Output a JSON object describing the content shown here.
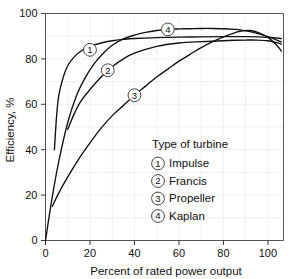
{
  "chart_data": {
    "type": "line",
    "title": "",
    "xlabel": "Percent of rated power output",
    "ylabel": "Efficiency, %",
    "xlim": [
      0,
      107
    ],
    "ylim": [
      0,
      100
    ],
    "xticks": [
      0,
      20,
      40,
      60,
      80,
      100
    ],
    "yticks": [
      0,
      20,
      40,
      60,
      80,
      100
    ],
    "xtick_labels": [
      "0",
      "20",
      "40",
      "60",
      "80",
      "100"
    ],
    "ytick_labels": [
      "0",
      "20",
      "40",
      "60",
      "80",
      "100"
    ],
    "grid": true,
    "grid_step": 10,
    "legend_position": "inside-center-right",
    "legend_title": "Type of turbine",
    "series": [
      {
        "id": 1,
        "name": "Impulse",
        "marker_label": "1",
        "marker_at": {
          "x": 20,
          "y": 84
        },
        "x": [
          4,
          5,
          6,
          8,
          10,
          13,
          16,
          20,
          25,
          30,
          35,
          40,
          50,
          60,
          70,
          80,
          90,
          100,
          106
        ],
        "y": [
          40,
          55,
          64,
          72,
          77,
          81,
          83.5,
          85.5,
          87,
          88,
          88.6,
          89,
          89.4,
          89.6,
          89.7,
          89.8,
          89.8,
          89.5,
          89
        ]
      },
      {
        "id": 2,
        "name": "Francis",
        "marker_label": "2",
        "marker_at": {
          "x": 28,
          "y": 75
        },
        "x": [
          10,
          13,
          16,
          20,
          25,
          30,
          35,
          40,
          50,
          60,
          70,
          80,
          85,
          90,
          95,
          100,
          104,
          106
        ],
        "y": [
          49,
          56,
          61.5,
          66.5,
          72,
          76.5,
          80,
          82.5,
          85.5,
          87,
          87.6,
          88,
          88.2,
          88.3,
          88.3,
          88,
          87.2,
          86.5
        ]
      },
      {
        "id": 3,
        "name": "Propeller",
        "marker_label": "3",
        "marker_at": {
          "x": 40,
          "y": 64
        },
        "x": [
          3,
          6,
          10,
          15,
          20,
          25,
          30,
          35,
          40,
          45,
          50,
          55,
          60,
          65,
          70,
          75,
          80,
          85,
          88,
          92,
          96,
          100,
          104,
          106
        ],
        "y": [
          15,
          21,
          28,
          36,
          43,
          49.5,
          55,
          59.5,
          64,
          68,
          72,
          75.5,
          79,
          82,
          85,
          87.5,
          89.7,
          91.5,
          92.3,
          92.5,
          91.5,
          89.5,
          86,
          83.5
        ]
      },
      {
        "id": 4,
        "name": "Kaplan",
        "marker_label": "4",
        "marker_at": {
          "x": 55,
          "y": 93
        },
        "x": [
          0,
          3,
          6,
          10,
          14,
          18,
          22,
          26,
          30,
          35,
          40,
          45,
          50,
          55,
          60,
          65,
          70,
          75,
          80,
          85,
          88,
          92,
          96,
          100,
          104,
          106
        ],
        "y": [
          0,
          19,
          35,
          52,
          64,
          72,
          78,
          82.5,
          86,
          88.8,
          90.5,
          91.7,
          92.5,
          93,
          93.2,
          93.3,
          93.4,
          93.4,
          93.3,
          93,
          92.7,
          92,
          91,
          89.8,
          88.3,
          87.5
        ]
      }
    ],
    "legend_entries": [
      {
        "marker": "1",
        "label": "Impulse"
      },
      {
        "marker": "2",
        "label": "Francis"
      },
      {
        "marker": "3",
        "label": "Propeller"
      },
      {
        "marker": "4",
        "label": "Kaplan"
      }
    ],
    "colors": {
      "curve": "#111111",
      "grid": "#e8e8e8",
      "frame": "#555555",
      "background": "#ffffff"
    }
  }
}
